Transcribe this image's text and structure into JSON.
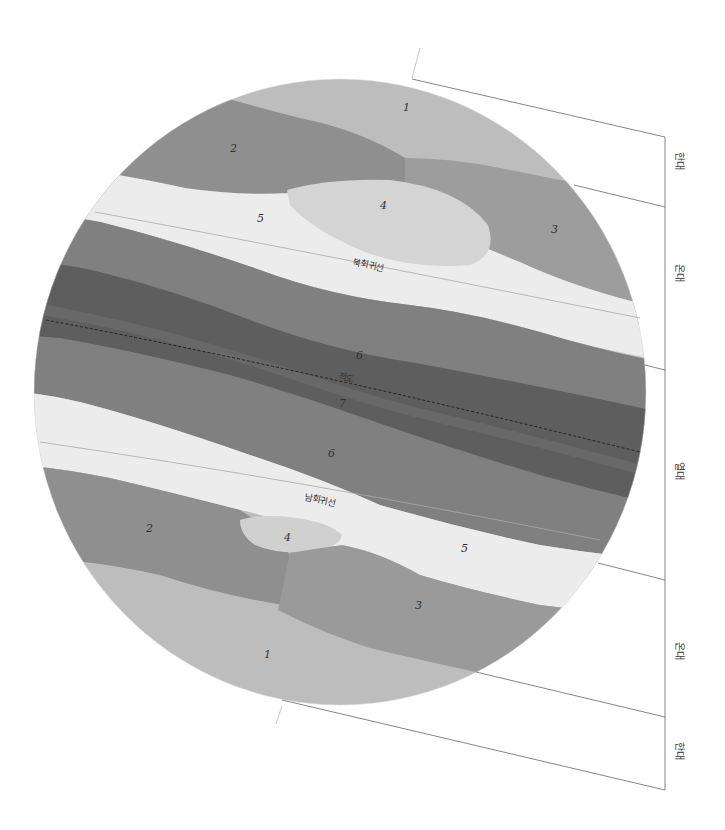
{
  "diagram": {
    "title": "",
    "zone_labels": [
      {
        "id": "north-frigid",
        "label": "한대",
        "x": 680,
        "y": 160
      },
      {
        "id": "north-temperate",
        "label": "온대",
        "x": 680,
        "y": 272
      },
      {
        "id": "torrid",
        "label": "열대",
        "x": 680,
        "y": 470
      },
      {
        "id": "south-temperate",
        "label": "온대",
        "x": 680,
        "y": 650
      },
      {
        "id": "south-frigid",
        "label": "한대",
        "x": 680,
        "y": 750
      }
    ],
    "latitude_labels": {
      "tropic_of_cancer": "북회귀선",
      "equator": "적도",
      "tropic_of_capricorn": "남회귀선"
    },
    "region_numbers": {
      "north_1": "1",
      "north_2": "2",
      "north_3": "3",
      "north_4": "4",
      "north_5": "5",
      "north_6": "6",
      "center_7": "7",
      "south_6": "6",
      "south_5": "5",
      "south_4": "4",
      "south_3": "3",
      "south_2": "2",
      "south_1": "1"
    },
    "colors": {
      "region_1": "#bdbdbd",
      "region_2": "#8f8f8f",
      "region_3": "#9a9a9a",
      "region_4": "#d2d2d2",
      "region_5": "#ececec",
      "region_6": "#7f7f7f",
      "region_7": "#5f5f5f",
      "line": "#6a6a6a"
    }
  }
}
